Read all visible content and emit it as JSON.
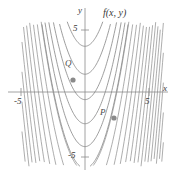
{
  "figure": {
    "title": "",
    "surface_label": "f(x, y)",
    "background": "#ffffff",
    "curve_color": "#8c8c8c",
    "axis_color": "#8c8c8c",
    "label_color": "#3a3a3a",
    "point_color": "#8a8a8a"
  },
  "axes": {
    "x_label": "x",
    "y_label": "y",
    "x_ticks": [
      {
        "value": -5,
        "label": "-5",
        "px": 21,
        "py": 104
      },
      {
        "value": 5,
        "label": "5",
        "px": 147,
        "py": 104
      }
    ],
    "y_ticks": [
      {
        "value": 5,
        "label": "5",
        "px": 73,
        "py": 30
      },
      {
        "value": -5,
        "label": "-5",
        "px": 71,
        "py": 159
      }
    ],
    "origin_px": {
      "x": 85,
      "y": 92
    },
    "x_axis_y_px": 92,
    "y_axis_x_px": 85,
    "xlim": [
      -6.8,
      7.2
    ],
    "ylim": [
      -6.3,
      6.3
    ],
    "grid": false
  },
  "points": [
    {
      "name": "P",
      "label": "P",
      "label_px": {
        "x": 103,
        "y": 113
      },
      "dot_px": {
        "x": 114,
        "y": 118
      }
    },
    {
      "name": "Q",
      "label": "Q",
      "label_px": {
        "x": 68,
        "y": 64
      },
      "dot_px": {
        "x": 73,
        "y": 80
      }
    }
  ],
  "chart_data": {
    "type": "line",
    "title": "",
    "subtitle": "",
    "xlabel": "x",
    "ylabel": "y",
    "xlim": [
      -6.8,
      7.2
    ],
    "ylim": [
      -6.3,
      6.3
    ],
    "grid": false,
    "legend": "none",
    "annotations": [
      {
        "text": "f(x, y)",
        "x_px": 103,
        "y_px": 14
      },
      {
        "text": "P",
        "x_px": 103,
        "y_px": 113
      },
      {
        "text": "Q",
        "x_px": 68,
        "y_px": 64
      }
    ],
    "tick_labels": {
      "x": [
        "-5",
        "5"
      ],
      "y": [
        "5",
        "-5"
      ]
    },
    "series": [
      {
        "name": "level-curve-1",
        "c": 3.6,
        "vertex": [
          0.0,
          3.6
        ]
      },
      {
        "name": "level-curve-2",
        "c": 1.4,
        "vertex": [
          0.0,
          1.4
        ]
      },
      {
        "name": "level-curve-3",
        "c": -0.6,
        "vertex": [
          0.0,
          -0.6
        ]
      },
      {
        "name": "level-curve-4",
        "c": -2.5,
        "vertex": [
          0.0,
          -2.5
        ]
      },
      {
        "name": "level-curve-5",
        "c": -4.3,
        "vertex": [
          0.0,
          -4.3
        ]
      },
      {
        "name": "level-curve-6",
        "c": -6.0,
        "vertex": [
          0.0,
          -6.0
        ]
      },
      {
        "name": "dense-family-left",
        "count": 26,
        "note": "tightly spaced parabola branches filling the left half"
      }
    ],
    "curve_equation": "y = x^2 + c"
  }
}
